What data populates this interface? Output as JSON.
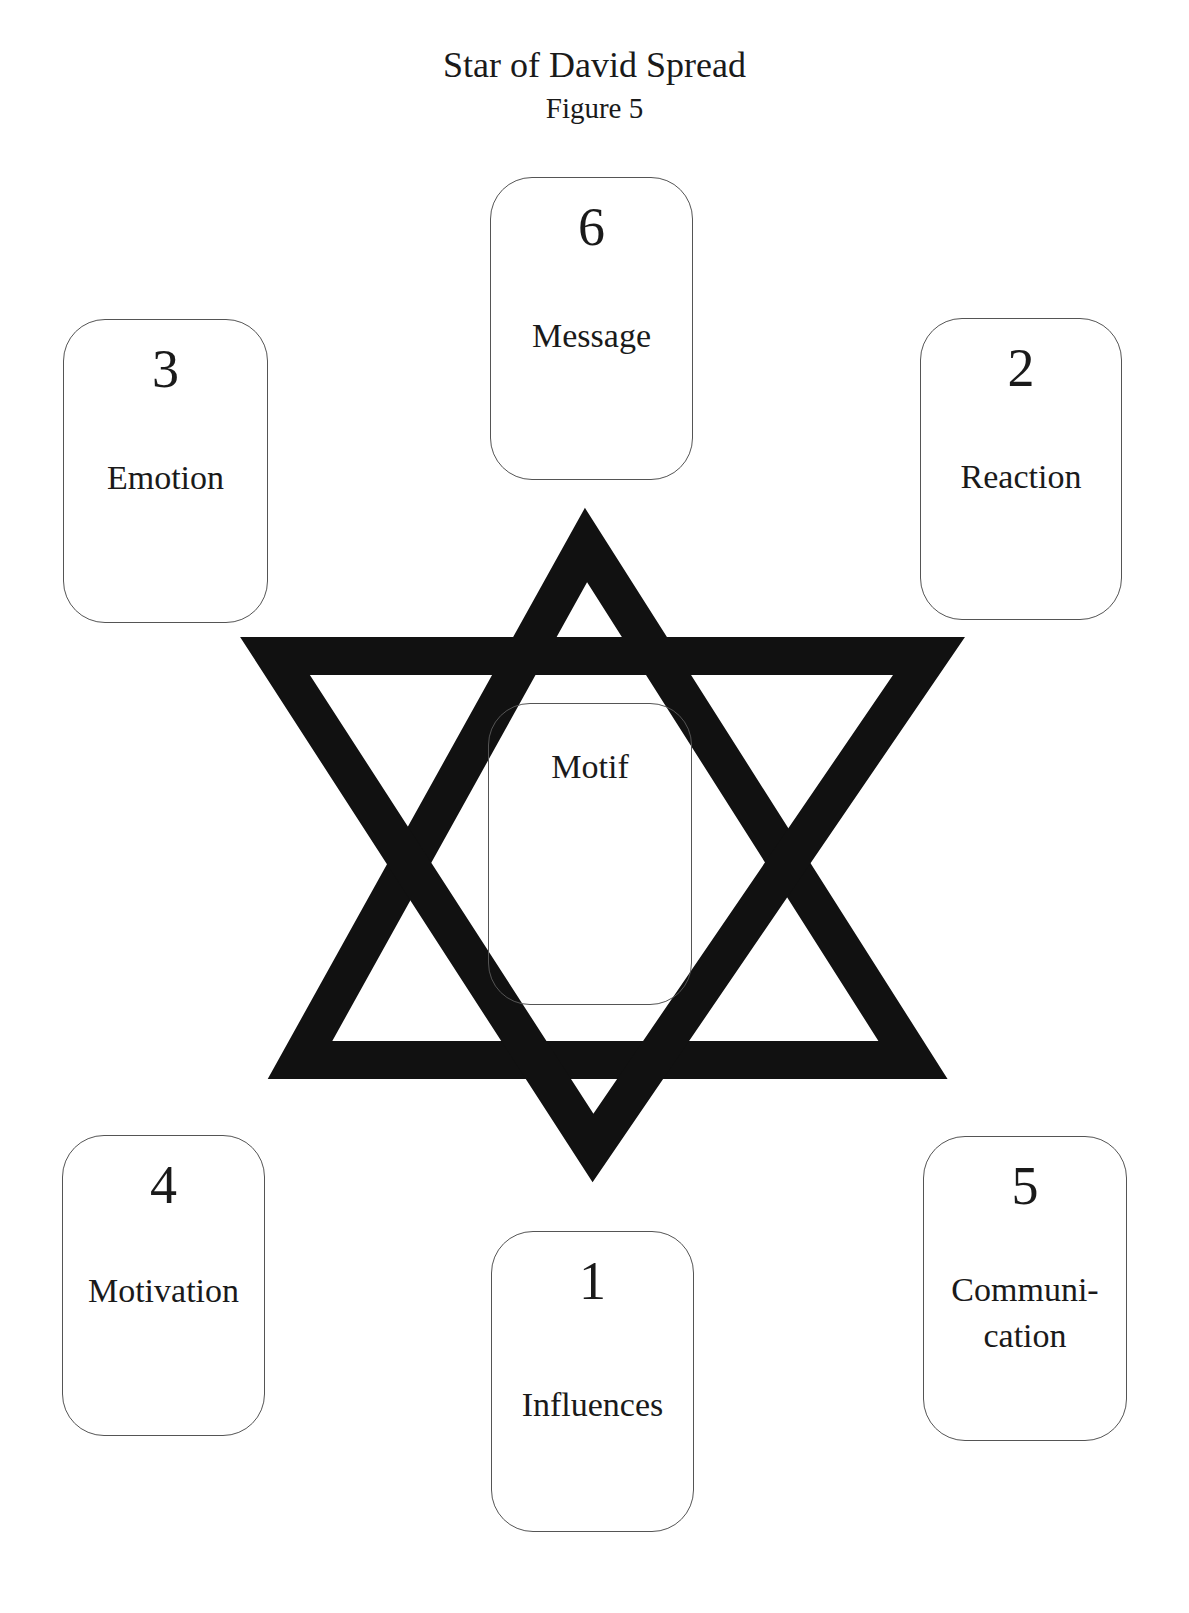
{
  "header": {
    "title": "Star of David Spread",
    "subtitle": "Figure 5"
  },
  "star": {
    "color": "#111111"
  },
  "cards": {
    "c6": {
      "number": "6",
      "label": "Message"
    },
    "c3": {
      "number": "3",
      "label": "Emotion"
    },
    "c2": {
      "number": "2",
      "label": "Reaction"
    },
    "center": {
      "label": "Motif"
    },
    "c4": {
      "number": "4",
      "label": "Motivation"
    },
    "c5": {
      "number": "5",
      "label_line1": "Communi-",
      "label_line2": "cation"
    },
    "c1": {
      "number": "1",
      "label": "Influences"
    }
  }
}
